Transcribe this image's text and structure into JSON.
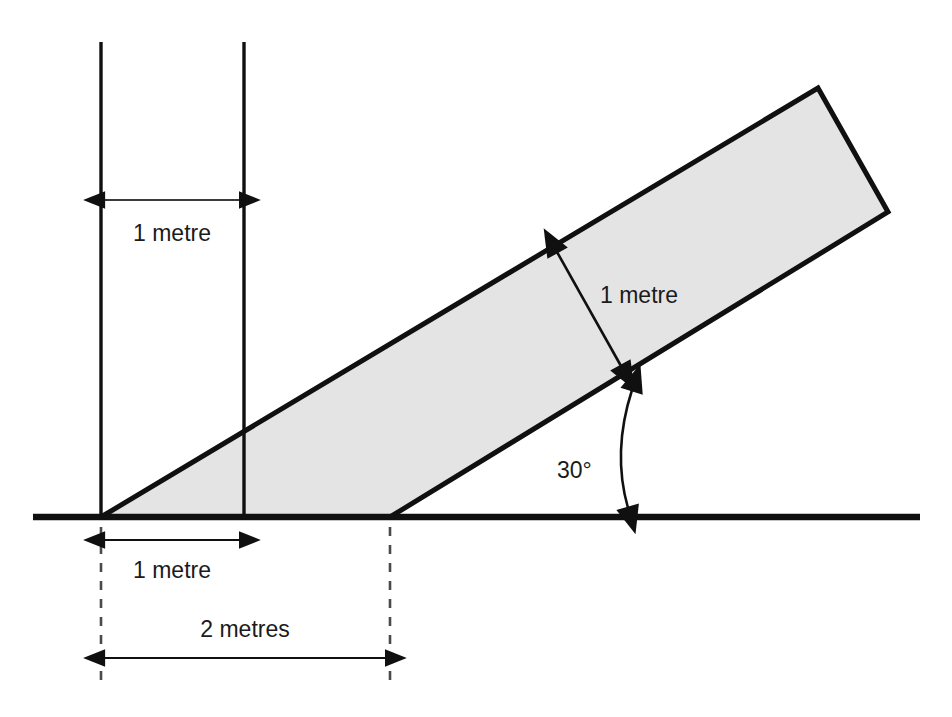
{
  "diagram": {
    "type": "geometry-diagram",
    "colors": {
      "slab_fill": "#e4e4e4",
      "stroke": "#101010",
      "ground": "#101010",
      "dashed": "#4a4a4a",
      "text": "#1b1b1b",
      "background": "#ffffff"
    },
    "labels": {
      "top_width": "1 metre",
      "slab_thickness": "1 metre",
      "base_offset": "1 metre",
      "base_span": "2 metres",
      "incline_angle": "30°"
    },
    "measurements": {
      "top_width_value": 1,
      "top_width_unit": "metre",
      "slab_thickness_value": 1,
      "slab_thickness_unit": "metre",
      "base_offset_value": 1,
      "base_offset_unit": "metre",
      "base_span_value": 2,
      "base_span_unit": "metres",
      "incline_angle_value": 30,
      "incline_angle_unit": "degrees"
    },
    "geometry": {
      "ground_line": {
        "x1": 33,
        "y1": 517,
        "x2": 920,
        "y2": 517,
        "width": 6
      },
      "vertical_line_left": {
        "x": 101,
        "y1": 42,
        "y2": 517
      },
      "vertical_line_right": {
        "x": 244,
        "y1": 42,
        "y2": 517
      },
      "slab_polygon": "101,517 818,88 888,212 390,517",
      "top_dim_arrow": {
        "x1": 101,
        "x2": 244,
        "y": 200
      },
      "thickness_dim_arrow": {
        "x1": 556,
        "y1": 250,
        "x2": 622,
        "y2": 368
      },
      "base_offset_arrow": {
        "x1": 101,
        "x2": 244,
        "y": 540
      },
      "base_span_arrow": {
        "x1": 101,
        "x2": 390,
        "y": 658
      },
      "dashed_left": {
        "x": 101,
        "y1": 527,
        "y2": 682
      },
      "dashed_right": {
        "x": 390,
        "y1": 527,
        "y2": 682
      },
      "angle_arc": {
        "cx": 630,
        "cy": 517,
        "radius": 130,
        "from_deg": 0,
        "to_deg": 30
      }
    }
  }
}
